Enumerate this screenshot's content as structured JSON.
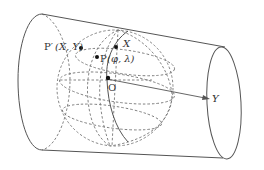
{
  "figure": {
    "labels": {
      "p_prime": "P′",
      "p_prime_coords": "(X, Y)",
      "p": "P",
      "p_coords": "(φ, λ)",
      "x_axis": "X",
      "y_axis": "Y",
      "origin": "O"
    },
    "colors": {
      "stroke": "#555555",
      "dashed": "#777777",
      "point": "#111111",
      "background": "#ffffff"
    }
  }
}
